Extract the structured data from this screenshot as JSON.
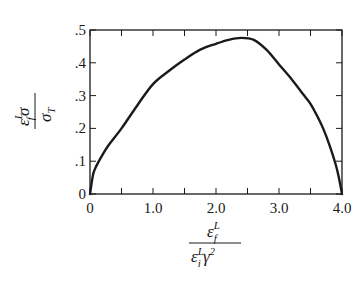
{
  "chart_data": {
    "type": "line",
    "title": "",
    "xlabel": "ε_f^L / (ε_i^L γ^2)",
    "ylabel": "ε_f^L σ / σ_T",
    "xlim": [
      0,
      4.0
    ],
    "ylim": [
      0,
      0.5
    ],
    "grid": false,
    "legend": null,
    "x_ticks": [
      "0",
      "1.0",
      "2.0",
      "3.0",
      "4.0"
    ],
    "x_tick_values": [
      0,
      1.0,
      2.0,
      3.0,
      4.0
    ],
    "x_minor_ticks": [
      0.5,
      1.5,
      2.5,
      3.5
    ],
    "y_ticks": [
      "0",
      ".1",
      ".2",
      ".3",
      ".4",
      ".5"
    ],
    "y_tick_values": [
      0,
      0.1,
      0.2,
      0.3,
      0.4,
      0.5
    ],
    "series": [
      {
        "name": "curve",
        "color": "#1a1a1a",
        "x": [
          0,
          0.05,
          0.1,
          0.2,
          0.3,
          0.5,
          0.75,
          1.0,
          1.25,
          1.5,
          1.75,
          2.0,
          2.2,
          2.4,
          2.6,
          2.8,
          3.0,
          3.2,
          3.4,
          3.5,
          3.6,
          3.7,
          3.8,
          3.9,
          3.95,
          4.0
        ],
        "y": [
          0,
          0.06,
          0.085,
          0.12,
          0.15,
          0.2,
          0.27,
          0.335,
          0.375,
          0.41,
          0.44,
          0.458,
          0.47,
          0.476,
          0.47,
          0.44,
          0.395,
          0.35,
          0.3,
          0.275,
          0.24,
          0.2,
          0.15,
          0.09,
          0.05,
          0
        ]
      }
    ],
    "peak": {
      "x": 2.4,
      "y": 0.476
    }
  },
  "axis_labels": {
    "y_num_main": "ε",
    "y_num_sup": "L",
    "y_num_sub": "f",
    "y_num_tail": "σ",
    "y_den_main": "σ",
    "y_den_sub": "T",
    "x_num_main": "ε",
    "x_num_sup": "L",
    "x_num_sub": "f",
    "x_den_main": "ε",
    "x_den_sup": "L",
    "x_den_sub": "i",
    "x_den_tail": "γ",
    "x_den_tail_sup": "2"
  }
}
